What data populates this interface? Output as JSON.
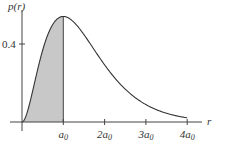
{
  "chart_data": {
    "type": "area",
    "title": "",
    "xlabel": "r",
    "ylabel": "p(r)",
    "function": "p(r) = (4 r^2 / a0^3) e^(-2r/a0)",
    "x_ticks": [
      {
        "value": 1,
        "label_main": "a",
        "label_sub": "0"
      },
      {
        "value": 2,
        "label_main": "2a",
        "label_sub": "0"
      },
      {
        "value": 3,
        "label_main": "3a",
        "label_sub": "0"
      },
      {
        "value": 4,
        "label_main": "4a",
        "label_sub": "0"
      }
    ],
    "y_ticks": [
      {
        "value": 0.4,
        "label": "0.4"
      }
    ],
    "xlim": [
      0,
      4.6
    ],
    "ylim": [
      0,
      0.6
    ],
    "x": [
      0,
      0.25,
      0.5,
      0.75,
      1.0,
      1.5,
      2.0,
      2.5,
      3.0,
      3.5,
      4.0
    ],
    "values": [
      0,
      0.152,
      0.368,
      0.502,
      0.541,
      0.448,
      0.293,
      0.168,
      0.089,
      0.045,
      0.021
    ],
    "shaded_region": {
      "from": 0,
      "to": 1,
      "color": "#c8c8c8"
    },
    "peak": {
      "x": 1,
      "y": 0.541
    },
    "grid": false,
    "colors": {
      "curve": "#333333",
      "axis": "#444444",
      "fill": "#c8c8c8"
    }
  },
  "labels": {
    "y_axis": "p(r)",
    "x_axis": "r",
    "y_tick_04": "0.4"
  }
}
